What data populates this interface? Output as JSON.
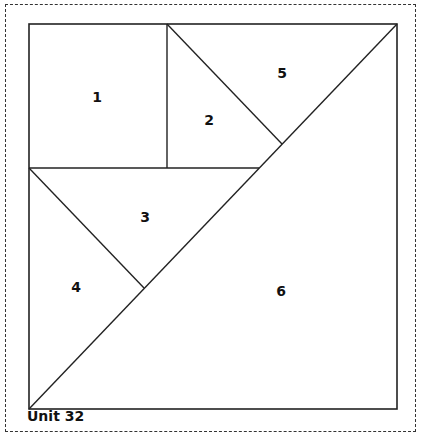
{
  "title": "Unit 32",
  "pieces": [
    {
      "id": "piece-1",
      "label": "1",
      "x": 97,
      "y": 97
    },
    {
      "id": "piece-2",
      "label": "2",
      "x": 209,
      "y": 120
    },
    {
      "id": "piece-3",
      "label": "3",
      "x": 145,
      "y": 217
    },
    {
      "id": "piece-4",
      "label": "4",
      "x": 76,
      "y": 287
    },
    {
      "id": "piece-5",
      "label": "5",
      "x": 282,
      "y": 73
    },
    {
      "id": "piece-6",
      "label": "6",
      "x": 281,
      "y": 291
    }
  ],
  "colors": {
    "line": "#222222",
    "border": "#333333",
    "background": "#ffffff"
  }
}
